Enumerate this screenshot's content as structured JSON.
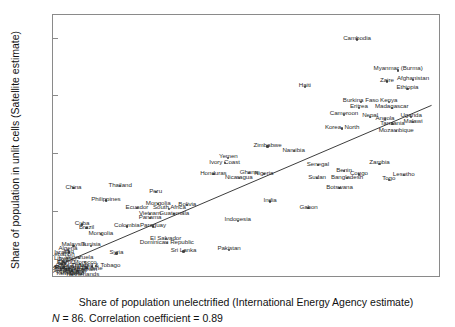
{
  "chart_data": {
    "type": "scatter",
    "title": "",
    "xlabel": "Share of population unelectrified (International Energy Agency estimate)",
    "ylabel": "Share of population in unlit cells (Satellite estimate)",
    "xlim": [
      -0.02,
      1.02
    ],
    "ylim": [
      -0.03,
      0.88
    ],
    "xticks": [
      "0",
      ".2",
      ".4",
      ".6",
      ".8",
      "1"
    ],
    "xtick_values": [
      0,
      0.2,
      0.4,
      0.6,
      0.8,
      1
    ],
    "yticks": [
      "0",
      ".2",
      ".4",
      ".6",
      ".8"
    ],
    "ytick_values": [
      0,
      0.2,
      0.4,
      0.6,
      0.8
    ],
    "grid": false,
    "legend": false,
    "caption": "N = 86. Correlation coefficient = 0.89",
    "n": 86,
    "correlation": 0.89,
    "fit_line": {
      "type": "linear",
      "x_start": -0.02,
      "y_start": 0.0,
      "x_end": 1.0,
      "y_end": 0.565
    },
    "points": [
      {
        "label": "Cambodia",
        "x": 0.795,
        "y": 0.795,
        "lx": 0.795,
        "ly": 0.805
      },
      {
        "label": "Myanmar (Burma)",
        "x": 0.905,
        "y": 0.688,
        "lx": 0.905,
        "ly": 0.7
      },
      {
        "label": "Zaire",
        "x": 0.875,
        "y": 0.65,
        "lx": 0.875,
        "ly": 0.66
      },
      {
        "label": "Afghanistan",
        "x": 0.945,
        "y": 0.655,
        "lx": 0.945,
        "ly": 0.665
      },
      {
        "label": "Ethiopia",
        "x": 0.93,
        "y": 0.625,
        "lx": 0.93,
        "ly": 0.634
      },
      {
        "label": "Haiti",
        "x": 0.655,
        "y": 0.63,
        "lx": 0.655,
        "ly": 0.64
      },
      {
        "label": "Burkina Faso",
        "x": 0.805,
        "y": 0.578,
        "lx": 0.805,
        "ly": 0.588
      },
      {
        "label": "Kenya",
        "x": 0.88,
        "y": 0.578,
        "lx": 0.88,
        "ly": 0.588
      },
      {
        "label": "Eritrea",
        "x": 0.8,
        "y": 0.558,
        "lx": 0.8,
        "ly": 0.568
      },
      {
        "label": "Madagascar",
        "x": 0.888,
        "y": 0.558,
        "lx": 0.888,
        "ly": 0.568
      },
      {
        "label": "Cameroon",
        "x": 0.76,
        "y": 0.535,
        "lx": 0.76,
        "ly": 0.545
      },
      {
        "label": "Nepal",
        "x": 0.83,
        "y": 0.528,
        "lx": 0.83,
        "ly": 0.537
      },
      {
        "label": "Angola",
        "x": 0.87,
        "y": 0.52,
        "lx": 0.87,
        "ly": 0.528
      },
      {
        "label": "Uganda",
        "x": 0.94,
        "y": 0.528,
        "lx": 0.94,
        "ly": 0.537
      },
      {
        "label": "Malawi",
        "x": 0.945,
        "y": 0.51,
        "lx": 0.945,
        "ly": 0.518
      },
      {
        "label": "Tanzania",
        "x": 0.89,
        "y": 0.502,
        "lx": 0.89,
        "ly": 0.51
      },
      {
        "label": "Korea, North",
        "x": 0.755,
        "y": 0.487,
        "lx": 0.755,
        "ly": 0.496
      },
      {
        "label": "Mozambique",
        "x": 0.9,
        "y": 0.478,
        "lx": 0.9,
        "ly": 0.487
      },
      {
        "label": "Zimbabwe",
        "x": 0.555,
        "y": 0.425,
        "lx": 0.555,
        "ly": 0.434
      },
      {
        "label": "Namibia",
        "x": 0.625,
        "y": 0.41,
        "lx": 0.625,
        "ly": 0.418
      },
      {
        "label": "Yemen",
        "x": 0.45,
        "y": 0.385,
        "lx": 0.45,
        "ly": 0.394
      },
      {
        "label": "Ivory Coast",
        "x": 0.44,
        "y": 0.368,
        "lx": 0.44,
        "ly": 0.376
      },
      {
        "label": "Senegal",
        "x": 0.69,
        "y": 0.36,
        "lx": 0.69,
        "ly": 0.368
      },
      {
        "label": "Zambia",
        "x": 0.855,
        "y": 0.365,
        "lx": 0.855,
        "ly": 0.374
      },
      {
        "label": "Honduras",
        "x": 0.41,
        "y": 0.33,
        "lx": 0.41,
        "ly": 0.338
      },
      {
        "label": "Ghana",
        "x": 0.505,
        "y": 0.332,
        "lx": 0.505,
        "ly": 0.34
      },
      {
        "label": "Nigeria",
        "x": 0.545,
        "y": 0.33,
        "lx": 0.545,
        "ly": 0.338
      },
      {
        "label": "Benin",
        "x": 0.76,
        "y": 0.34,
        "lx": 0.76,
        "ly": 0.348
      },
      {
        "label": "Congo",
        "x": 0.8,
        "y": 0.328,
        "lx": 0.8,
        "ly": 0.336
      },
      {
        "label": "Lesotho",
        "x": 0.92,
        "y": 0.325,
        "lx": 0.92,
        "ly": 0.333
      },
      {
        "label": "Nicaragua",
        "x": 0.478,
        "y": 0.315,
        "lx": 0.478,
        "ly": 0.323
      },
      {
        "label": "Sudan",
        "x": 0.688,
        "y": 0.315,
        "lx": 0.688,
        "ly": 0.323
      },
      {
        "label": "Bangladesh",
        "x": 0.768,
        "y": 0.315,
        "lx": 0.768,
        "ly": 0.323
      },
      {
        "label": "Togo",
        "x": 0.88,
        "y": 0.31,
        "lx": 0.88,
        "ly": 0.318
      },
      {
        "label": "China",
        "x": 0.035,
        "y": 0.282,
        "lx": 0.035,
        "ly": 0.29
      },
      {
        "label": "Thailand",
        "x": 0.16,
        "y": 0.288,
        "lx": 0.16,
        "ly": 0.296
      },
      {
        "label": "Botswana",
        "x": 0.748,
        "y": 0.282,
        "lx": 0.748,
        "ly": 0.29
      },
      {
        "label": "Peru",
        "x": 0.255,
        "y": 0.268,
        "lx": 0.255,
        "ly": 0.276
      },
      {
        "label": "Philippines",
        "x": 0.122,
        "y": 0.238,
        "lx": 0.122,
        "ly": 0.246
      },
      {
        "label": "India",
        "x": 0.562,
        "y": 0.235,
        "lx": 0.562,
        "ly": 0.243
      },
      {
        "label": "Mongolia",
        "x": 0.262,
        "y": 0.225,
        "lx": 0.262,
        "ly": 0.233
      },
      {
        "label": "Bolivia",
        "x": 0.34,
        "y": 0.222,
        "lx": 0.34,
        "ly": 0.23
      },
      {
        "label": "Ecuador",
        "x": 0.205,
        "y": 0.212,
        "lx": 0.205,
        "ly": 0.22
      },
      {
        "label": "South Africa",
        "x": 0.292,
        "y": 0.21,
        "lx": 0.292,
        "ly": 0.218
      },
      {
        "label": "Gabon",
        "x": 0.665,
        "y": 0.212,
        "lx": 0.665,
        "ly": 0.22
      },
      {
        "label": "Vietnam",
        "x": 0.24,
        "y": 0.192,
        "lx": 0.24,
        "ly": 0.2
      },
      {
        "label": "Guatemala",
        "x": 0.305,
        "y": 0.192,
        "lx": 0.305,
        "ly": 0.2
      },
      {
        "label": "Panama",
        "x": 0.24,
        "y": 0.178,
        "lx": 0.24,
        "ly": 0.186
      },
      {
        "label": "Indonesia",
        "x": 0.475,
        "y": 0.168,
        "lx": 0.475,
        "ly": 0.176
      },
      {
        "label": "Cuba",
        "x": 0.058,
        "y": 0.155,
        "lx": 0.058,
        "ly": 0.163
      },
      {
        "label": "Colombia",
        "x": 0.178,
        "y": 0.148,
        "lx": 0.178,
        "ly": 0.156
      },
      {
        "label": "Paraguay",
        "x": 0.248,
        "y": 0.148,
        "lx": 0.248,
        "ly": 0.156
      },
      {
        "label": "Brazil",
        "x": 0.07,
        "y": 0.143,
        "lx": 0.07,
        "ly": 0.151
      },
      {
        "label": "Mongolia2",
        "x": 0.108,
        "y": 0.122,
        "lx": 0.108,
        "ly": 0.13
      },
      {
        "label": "El Salvador",
        "x": 0.282,
        "y": 0.105,
        "lx": 0.282,
        "ly": 0.113
      },
      {
        "label": "Dominican Republic",
        "x": 0.285,
        "y": 0.09,
        "lx": 0.285,
        "ly": 0.098
      },
      {
        "label": "Malaysia",
        "x": 0.035,
        "y": 0.082,
        "lx": 0.035,
        "ly": 0.09
      },
      {
        "label": "Tunisia",
        "x": 0.082,
        "y": 0.082,
        "lx": 0.082,
        "ly": 0.09
      },
      {
        "label": "Pakistan",
        "x": 0.452,
        "y": 0.068,
        "lx": 0.452,
        "ly": 0.076
      },
      {
        "label": "Sri Lanka",
        "x": 0.33,
        "y": 0.062,
        "lx": 0.33,
        "ly": 0.07
      },
      {
        "label": "Syria",
        "x": 0.15,
        "y": 0.055,
        "lx": 0.15,
        "ly": 0.063
      },
      {
        "label": "Algeria",
        "x": 0.02,
        "y": 0.068,
        "lx": 0.02,
        "ly": 0.076
      },
      {
        "label": "Iraq",
        "x": 0.022,
        "y": 0.058,
        "lx": 0.022,
        "ly": 0.066
      },
      {
        "label": "Venezuela",
        "x": 0.05,
        "y": 0.038,
        "lx": 0.05,
        "ly": 0.046
      },
      {
        "label": "Jordan",
        "x": 0.018,
        "y": 0.03,
        "lx": 0.018,
        "ly": 0.038
      },
      {
        "label": "Trinidad & Tobago",
        "x": 0.095,
        "y": 0.012,
        "lx": 0.095,
        "ly": 0.018
      },
      {
        "label": "Netherlands",
        "x": 0.06,
        "y": -0.008,
        "lx": 0.06,
        "ly": -0.013
      },
      {
        "label": "Egypt",
        "x": 0.012,
        "y": 0.02,
        "lx": 0.012,
        "ly": 0.028
      },
      {
        "label": "Mexico",
        "x": 0.01,
        "y": 0.01,
        "lx": 0.01,
        "ly": 0.012
      },
      {
        "label": "Turkey",
        "x": 0.008,
        "y": 0.004,
        "lx": 0.008,
        "ly": 0.004
      },
      {
        "label": "Argentina",
        "x": 0.015,
        "y": 0.0,
        "lx": 0.015,
        "ly": -0.002
      },
      {
        "label": "Chile",
        "x": 0.006,
        "y": 0.008,
        "lx": 0.006,
        "ly": 0.02
      },
      {
        "label": "Iran",
        "x": 0.004,
        "y": 0.014,
        "lx": 0.004,
        "ly": 0.034
      },
      {
        "label": "Libya",
        "x": 0.002,
        "y": 0.002,
        "lx": 0.002,
        "ly": 0.044
      },
      {
        "label": "Uruguay",
        "x": 0.03,
        "y": -0.004,
        "lx": 0.03,
        "ly": -0.007
      },
      {
        "label": "Costa Rica",
        "x": 0.024,
        "y": 0.006,
        "lx": 0.024,
        "ly": 0.006
      },
      {
        "label": "Jamaica",
        "x": 0.04,
        "y": 0.002,
        "lx": 0.04,
        "ly": 0.0
      },
      {
        "label": "Lebanon",
        "x": 0.006,
        "y": 0.026,
        "lx": 0.006,
        "ly": 0.056
      },
      {
        "label": "Israel",
        "x": 0.003,
        "y": 0.018,
        "lx": 0.003,
        "ly": 0.064
      },
      {
        "label": "Saudi Arabia",
        "x": 0.028,
        "y": 0.012,
        "lx": 0.028,
        "ly": 0.012
      },
      {
        "label": "Kuwait",
        "x": 0.014,
        "y": -0.002,
        "lx": 0.014,
        "ly": -0.01
      },
      {
        "label": "Oman",
        "x": 0.052,
        "y": 0.018,
        "lx": 0.052,
        "ly": 0.018
      },
      {
        "label": "Bahrain",
        "x": 0.07,
        "y": 0.006,
        "lx": 0.07,
        "ly": 0.004
      },
      {
        "label": "Qatar",
        "x": 0.044,
        "y": -0.006,
        "lx": 0.044,
        "ly": -0.009
      },
      {
        "label": "Morocco",
        "x": 0.066,
        "y": 0.026,
        "lx": 0.066,
        "ly": 0.028
      },
      {
        "label": "Ukraine",
        "x": 0.085,
        "y": 0.01,
        "lx": 0.085,
        "ly": 0.008
      }
    ]
  },
  "axis": {
    "ylabel": "Share of population in unlit cells (Satellite estimate)",
    "xlabel": "Share of population unelectrified (International Energy Agency estimate)"
  },
  "footnote": {
    "n_italic": "N",
    "rest": " = 86. Correlation coefficient = 0.89"
  }
}
